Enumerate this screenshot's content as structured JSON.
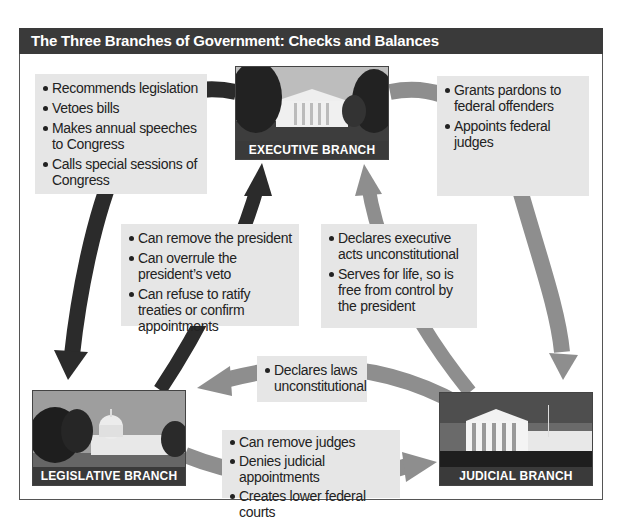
{
  "title": "The Three Branches of Government: Checks and Balances",
  "colors": {
    "title_bar": "#3a3a3a",
    "box_bg": "#e6e6e6",
    "dark_arrow": "#2b2b2b",
    "light_arrow": "#8e8e8e",
    "frame_border": "#555555"
  },
  "branches": {
    "executive": {
      "label": "EXECUTIVE BRANCH",
      "image": "white-house-photo"
    },
    "legislative": {
      "label": "LEGISLATIVE BRANCH",
      "image": "capitol-building-photo"
    },
    "judicial": {
      "label": "JUDICIAL BRANCH",
      "image": "supreme-court-photo"
    }
  },
  "checks": {
    "executive_on_legislative": [
      "Recommends legislation",
      "Vetoes bills",
      "Makes annual speeches to Congress",
      "Calls special sessions of Congress"
    ],
    "executive_on_judicial": [
      "Grants pardons to federal offenders",
      "Appoints federal judges"
    ],
    "legislative_on_executive": [
      "Can remove the president",
      "Can overrule the president’s veto",
      "Can refuse to ratify treaties or confirm appointments"
    ],
    "judicial_on_executive": [
      "Declares executive acts unconstitutional",
      "Serves for life, so is free from control by the president"
    ],
    "judicial_on_legislative": [
      "Declares laws unconstitutional"
    ],
    "legislative_on_judicial": [
      "Can remove judges",
      "Denies judicial appointments",
      "Creates lower federal courts"
    ]
  }
}
